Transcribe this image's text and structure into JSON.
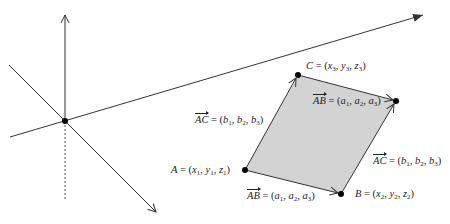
{
  "diagram": {
    "axes": {
      "color": "#333333",
      "origin": {
        "x": 65,
        "y": 121
      },
      "vertical_axis": {
        "from": [
          65,
          121
        ],
        "to": [
          65,
          14
        ]
      },
      "dashed_below": {
        "from": [
          65,
          121
        ],
        "to": [
          65,
          201
        ]
      },
      "x_axis": {
        "from": [
          10,
          137
        ],
        "to": [
          424,
          15
        ]
      },
      "diagonal_axis": {
        "from": [
          9,
          65
        ],
        "to": [
          156,
          213
        ]
      }
    },
    "parallelogram": {
      "fill": "#d3d3d3",
      "stroke": "#333333",
      "A": [
        245,
        170
      ],
      "B": [
        341,
        194
      ],
      "C": [
        298,
        75
      ],
      "D": [
        396,
        101
      ]
    },
    "labels": {
      "point_a": {
        "name": "A",
        "eq": " = (",
        "x": "x",
        "xs": "1",
        "y": "y",
        "ys": "1",
        "z": "z",
        "zs": "1",
        "close": ")"
      },
      "point_b": {
        "name": "B",
        "eq": " = (",
        "x": "x",
        "xs": "2",
        "y": "y",
        "ys": "2",
        "z": "z",
        "zs": "2",
        "close": ")"
      },
      "point_c": {
        "name": "C",
        "eq": " = (",
        "x": "x",
        "xs": "3",
        "y": "y",
        "ys": "3",
        "z": "z",
        "zs": "3",
        "close": ")"
      },
      "vec_ab_bottom": {
        "name": "AB",
        "eq": " = (",
        "c1": "a",
        "s1": "1",
        "c2": "a",
        "s2": "2",
        "c3": "a",
        "s3": "3",
        "close": ")"
      },
      "vec_ab_top": {
        "name": "AB",
        "eq": " = (",
        "c1": "a",
        "s1": "1",
        "c2": "a",
        "s2": "2",
        "c3": "a",
        "s3": "3",
        "close": ")"
      },
      "vec_ac_left": {
        "name": "AC",
        "eq": " = (",
        "c1": "b",
        "s1": "1",
        "c2": "b",
        "s2": "2",
        "c3": "b",
        "s3": "3",
        "close": ")"
      },
      "vec_ac_right": {
        "name": "AC",
        "eq": " = (",
        "c1": "b",
        "s1": "1",
        "c2": "b",
        "s2": "2",
        "c3": "b",
        "s3": "3",
        "close": ")"
      }
    },
    "separator": ", "
  }
}
